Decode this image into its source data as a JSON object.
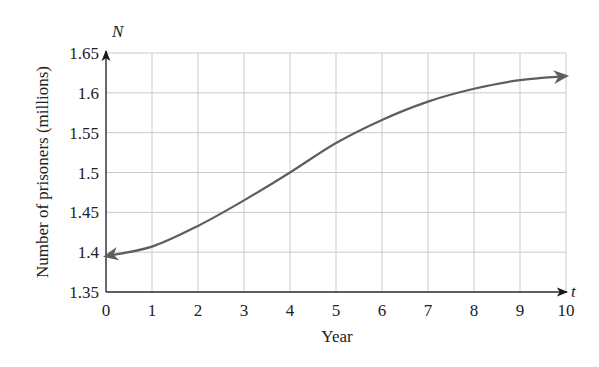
{
  "chart_data": {
    "type": "line",
    "title": "",
    "xlabel": "Year",
    "ylabel": "Number of prisoners (millions)",
    "x_var": "t",
    "y_var": "N",
    "xlim": [
      0,
      10
    ],
    "ylim": [
      1.35,
      1.65
    ],
    "grid": true,
    "legend": null,
    "x_ticks": [
      "0",
      "1",
      "2",
      "3",
      "4",
      "5",
      "6",
      "7",
      "8",
      "9",
      "10"
    ],
    "y_ticks": [
      "1.35",
      "1.4",
      "1.45",
      "1.5",
      "1.55",
      "1.6",
      "1.65"
    ],
    "series": [
      {
        "name": "N(t)",
        "x": [
          0,
          1,
          2,
          3,
          4,
          5,
          6,
          7,
          8,
          9,
          10
        ],
        "values": [
          1.395,
          1.407,
          1.433,
          1.465,
          1.5,
          1.537,
          1.566,
          1.589,
          1.605,
          1.616,
          1.621
        ],
        "color": "#5e5e5e",
        "arrows_at_ends": true
      }
    ]
  }
}
